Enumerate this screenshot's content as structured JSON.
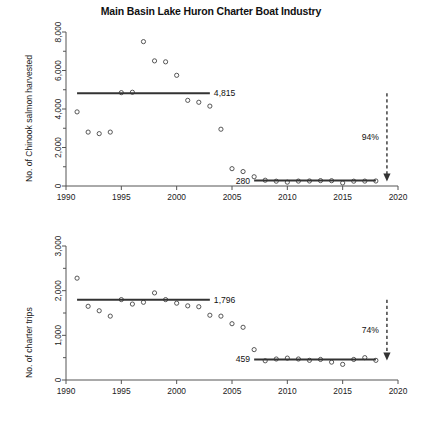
{
  "figure": {
    "title": "Main Basin Lake Huron Charter Boat Industry",
    "background": "#ffffff",
    "point_color": "#444444",
    "line_color": "#333333"
  },
  "chart_data": [
    {
      "type": "scatter",
      "panel": "top",
      "title": "Main Basin Lake Huron Charter Boat Industry",
      "xlabel": "",
      "ylabel": "No. of Chinook salmon harvested",
      "xlim": [
        1990,
        2020
      ],
      "ylim": [
        0,
        8000
      ],
      "xticks": [
        1990,
        1995,
        2000,
        2005,
        2010,
        2015,
        2020
      ],
      "xticklabels": [
        "1990",
        "1995",
        "2000",
        "2005",
        "2010",
        "2015",
        "2020"
      ],
      "yticks": [
        0,
        2000,
        4000,
        6000,
        8000
      ],
      "yticklabels": [
        "0",
        "2,000",
        "4,000",
        "6,000",
        "8,000"
      ],
      "grid": false,
      "legend": "none",
      "x": [
        1991,
        1992,
        1993,
        1994,
        1995,
        1996,
        1997,
        1998,
        1999,
        2000,
        2001,
        2002,
        2003,
        2004,
        2005,
        2006,
        2007,
        2008,
        2009,
        2010,
        2011,
        2012,
        2013,
        2014,
        2015,
        2016,
        2017,
        2018
      ],
      "values": [
        3850,
        2800,
        2720,
        2800,
        4850,
        4870,
        7500,
        6500,
        6450,
        5750,
        4450,
        4350,
        4150,
        2950,
        900,
        750,
        480,
        300,
        250,
        200,
        255,
        260,
        280,
        275,
        160,
        250,
        255,
        260
      ],
      "annotations": [
        {
          "name": "mean-label-early",
          "text": "4,815",
          "value": 4815,
          "x_start": 1991,
          "x_end": 2003
        },
        {
          "name": "mean-label-late",
          "text": "280",
          "value": 280,
          "x_start": 2007,
          "x_end": 2018
        },
        {
          "name": "percent-change",
          "text": "94%"
        }
      ],
      "mean_lines": [
        {
          "name": "early-period-mean",
          "value": 4815,
          "x_start": 1991,
          "x_end": 2003
        },
        {
          "name": "late-period-mean",
          "value": 280,
          "x_start": 2007,
          "x_end": 2018
        }
      ],
      "arrow": {
        "name": "decline-arrow",
        "x": 2019,
        "y_start": 4815,
        "y_end": 280,
        "label": "94%",
        "style": "dashed-down"
      }
    },
    {
      "type": "scatter",
      "panel": "bottom",
      "title": "",
      "xlabel": "",
      "ylabel": "No. of charter trips",
      "xlim": [
        1990,
        2020
      ],
      "ylim": [
        0,
        3000
      ],
      "xticks": [
        1990,
        1995,
        2000,
        2005,
        2010,
        2015,
        2020
      ],
      "xticklabels": [
        "1990",
        "1995",
        "2000",
        "2005",
        "2010",
        "2015",
        "2020"
      ],
      "yticks": [
        0,
        1000,
        2000,
        3000
      ],
      "yticklabels": [
        "0",
        "1,000",
        "2,000",
        "3,000"
      ],
      "grid": false,
      "legend": "none",
      "x": [
        1991,
        1992,
        1993,
        1994,
        1995,
        1996,
        1997,
        1998,
        1999,
        2000,
        2001,
        2002,
        2003,
        2004,
        2005,
        2006,
        2007,
        2008,
        2009,
        2010,
        2011,
        2012,
        2013,
        2014,
        2015,
        2016,
        2017,
        2018
      ],
      "values": [
        2280,
        1650,
        1550,
        1430,
        1800,
        1700,
        1740,
        1950,
        1800,
        1720,
        1660,
        1640,
        1450,
        1430,
        1260,
        1180,
        680,
        430,
        470,
        490,
        470,
        440,
        460,
        400,
        350,
        460,
        500,
        440
      ],
      "annotations": [
        {
          "name": "mean-label-early",
          "text": "1,796",
          "value": 1796,
          "x_start": 1991,
          "x_end": 2003
        },
        {
          "name": "mean-label-late",
          "text": "459",
          "value": 459,
          "x_start": 2007,
          "x_end": 2018
        },
        {
          "name": "percent-change",
          "text": "74%"
        }
      ],
      "mean_lines": [
        {
          "name": "early-period-mean",
          "value": 1796,
          "x_start": 1991,
          "x_end": 2003
        },
        {
          "name": "late-period-mean",
          "value": 459,
          "x_start": 2007,
          "x_end": 2018
        }
      ],
      "arrow": {
        "name": "decline-arrow",
        "x": 2019,
        "y_start": 1796,
        "y_end": 459,
        "label": "74%",
        "style": "dashed-down"
      }
    }
  ]
}
